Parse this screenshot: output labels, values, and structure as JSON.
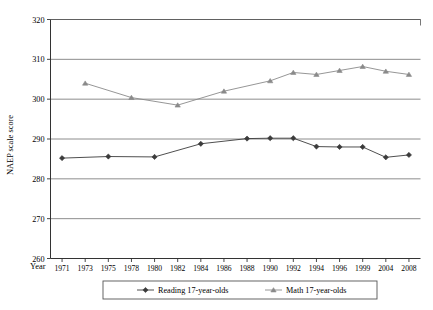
{
  "chart_data": {
    "type": "line",
    "title": "",
    "subtitle": "",
    "xlabel": "Year",
    "ylabel": "NAEP scale score",
    "categories": [
      "1971",
      "1973",
      "1975",
      "1978",
      "1980",
      "1982",
      "1984",
      "1986",
      "1988",
      "1990",
      "1992",
      "1994",
      "1996",
      "1999",
      "2004",
      "2008"
    ],
    "xtick_labels": [
      "1971",
      "1973",
      "1975",
      "1978",
      "1980",
      "1982",
      "1984",
      "1986",
      "1988",
      "1990",
      "1992",
      "1994",
      "1996",
      "1999",
      "2004",
      "2008"
    ],
    "ytick_labels": [
      "260",
      "270",
      "280",
      "290",
      "300",
      "310",
      "320"
    ],
    "yticks": [
      260,
      270,
      280,
      290,
      300,
      310,
      320
    ],
    "ylim": [
      260,
      320
    ],
    "grid": true,
    "grid_axis": "y",
    "legend_position": "bottom",
    "series": [
      {
        "name": "Reading 17-year-olds",
        "marker": "diamond",
        "color": "#3b3b3b",
        "x": [
          "1971",
          "1975",
          "1980",
          "1984",
          "1988",
          "1990",
          "1992",
          "1994",
          "1996",
          "1999",
          "2004",
          "2008"
        ],
        "values": [
          285.2,
          285.6,
          285.5,
          288.8,
          290.1,
          290.2,
          290.2,
          288.1,
          288.0,
          288.0,
          285.4,
          286.0
        ]
      },
      {
        "name": "Math 17-year-olds",
        "marker": "triangle",
        "color": "#8a8a8a",
        "x": [
          "1973",
          "1978",
          "1982",
          "1986",
          "1990",
          "1992",
          "1994",
          "1996",
          "1999",
          "2004",
          "2008"
        ],
        "values": [
          304.0,
          300.4,
          298.5,
          302.0,
          304.6,
          306.7,
          306.2,
          307.2,
          308.2,
          307.0,
          306.2
        ]
      }
    ]
  },
  "axes": {
    "y_title": "NAEP scale score",
    "x_title": "Year"
  },
  "legend": {
    "items": [
      {
        "label": "Reading 17-year-olds",
        "marker": "diamond",
        "color": "#3b3b3b"
      },
      {
        "label": "Math 17-year-olds",
        "marker": "triangle",
        "color": "#8a8a8a"
      }
    ]
  },
  "colors": {
    "reading": "#3b3b3b",
    "math": "#8a8a8a",
    "grid": "#808080",
    "axis": "#333333",
    "background": "#ffffff"
  }
}
